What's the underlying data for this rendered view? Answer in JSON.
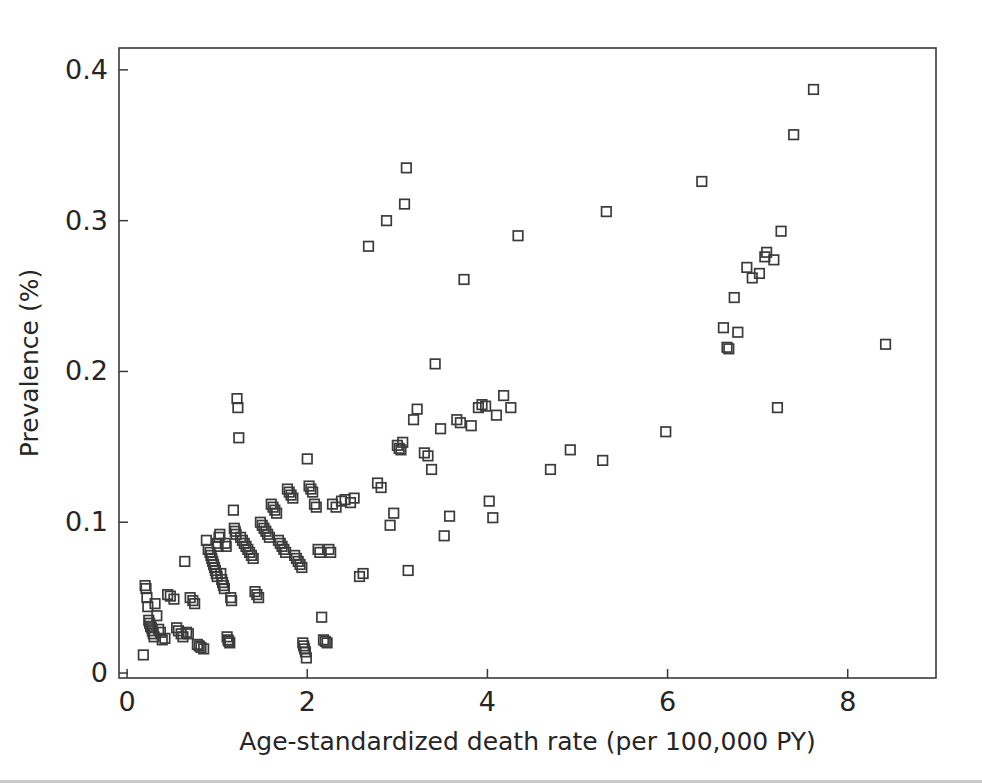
{
  "figure": {
    "background_color": "#ffffff",
    "marker_color": "#3b3b3b",
    "axis_color": "#3a3a3a",
    "marker_shape": "open-square"
  },
  "chart_data": {
    "type": "scatter",
    "title": "",
    "xlabel": "Age-standardized death rate (per 100,000 PY)",
    "ylabel": "Prevalence (%)",
    "xlim": [
      -0.09,
      8.98
    ],
    "ylim": [
      -0.0033,
      0.4145
    ],
    "xticks": [
      0,
      2,
      4,
      6,
      8
    ],
    "xticklabels": [
      "0",
      "2",
      "4",
      "6",
      "8"
    ],
    "yticks": [
      0,
      0.1,
      0.2,
      0.3,
      0.4
    ],
    "yticklabels": [
      "0",
      "0.1",
      "0.2",
      "0.3",
      "0.4"
    ],
    "grid": false,
    "legend": null,
    "series": [
      {
        "name": "countries",
        "marker": "open-square",
        "points": [
          [
            0.18,
            0.012
          ],
          [
            0.2,
            0.058
          ],
          [
            0.21,
            0.056
          ],
          [
            0.22,
            0.05
          ],
          [
            0.23,
            0.044
          ],
          [
            0.24,
            0.035
          ],
          [
            0.25,
            0.033
          ],
          [
            0.26,
            0.031
          ],
          [
            0.27,
            0.03
          ],
          [
            0.28,
            0.028
          ],
          [
            0.29,
            0.026
          ],
          [
            0.3,
            0.024
          ],
          [
            0.31,
            0.046
          ],
          [
            0.33,
            0.038
          ],
          [
            0.35,
            0.029
          ],
          [
            0.37,
            0.027
          ],
          [
            0.39,
            0.022
          ],
          [
            0.42,
            0.023
          ],
          [
            0.45,
            0.052
          ],
          [
            0.48,
            0.051
          ],
          [
            0.52,
            0.049
          ],
          [
            0.55,
            0.03
          ],
          [
            0.57,
            0.028
          ],
          [
            0.6,
            0.026
          ],
          [
            0.62,
            0.024
          ],
          [
            0.64,
            0.074
          ],
          [
            0.66,
            0.027
          ],
          [
            0.68,
            0.026
          ],
          [
            0.7,
            0.05
          ],
          [
            0.73,
            0.048
          ],
          [
            0.75,
            0.046
          ],
          [
            0.78,
            0.019
          ],
          [
            0.8,
            0.018
          ],
          [
            0.82,
            0.017
          ],
          [
            0.85,
            0.016
          ],
          [
            0.88,
            0.088
          ],
          [
            0.9,
            0.082
          ],
          [
            0.92,
            0.08
          ],
          [
            0.93,
            0.078
          ],
          [
            0.94,
            0.076
          ],
          [
            0.95,
            0.074
          ],
          [
            0.96,
            0.072
          ],
          [
            0.97,
            0.07
          ],
          [
            0.98,
            0.068
          ],
          [
            0.99,
            0.066
          ],
          [
            1.0,
            0.064
          ],
          [
            1.0,
            0.086
          ],
          [
            1.01,
            0.084
          ],
          [
            1.02,
            0.09
          ],
          [
            1.03,
            0.092
          ],
          [
            1.04,
            0.066
          ],
          [
            1.05,
            0.062
          ],
          [
            1.06,
            0.06
          ],
          [
            1.07,
            0.058
          ],
          [
            1.08,
            0.056
          ],
          [
            1.09,
            0.086
          ],
          [
            1.1,
            0.084
          ],
          [
            1.11,
            0.024
          ],
          [
            1.12,
            0.022
          ],
          [
            1.13,
            0.021
          ],
          [
            1.14,
            0.02
          ],
          [
            1.15,
            0.05
          ],
          [
            1.16,
            0.048
          ],
          [
            1.18,
            0.108
          ],
          [
            1.19,
            0.096
          ],
          [
            1.2,
            0.094
          ],
          [
            1.21,
            0.092
          ],
          [
            1.22,
            0.182
          ],
          [
            1.23,
            0.176
          ],
          [
            1.24,
            0.156
          ],
          [
            1.26,
            0.09
          ],
          [
            1.28,
            0.088
          ],
          [
            1.3,
            0.086
          ],
          [
            1.32,
            0.084
          ],
          [
            1.34,
            0.082
          ],
          [
            1.36,
            0.08
          ],
          [
            1.38,
            0.078
          ],
          [
            1.4,
            0.076
          ],
          [
            1.42,
            0.054
          ],
          [
            1.44,
            0.052
          ],
          [
            1.46,
            0.05
          ],
          [
            1.48,
            0.1
          ],
          [
            1.5,
            0.098
          ],
          [
            1.52,
            0.096
          ],
          [
            1.54,
            0.094
          ],
          [
            1.56,
            0.092
          ],
          [
            1.58,
            0.09
          ],
          [
            1.6,
            0.112
          ],
          [
            1.62,
            0.11
          ],
          [
            1.64,
            0.108
          ],
          [
            1.66,
            0.106
          ],
          [
            1.68,
            0.088
          ],
          [
            1.7,
            0.086
          ],
          [
            1.72,
            0.084
          ],
          [
            1.74,
            0.082
          ],
          [
            1.76,
            0.08
          ],
          [
            1.78,
            0.122
          ],
          [
            1.8,
            0.12
          ],
          [
            1.82,
            0.118
          ],
          [
            1.84,
            0.116
          ],
          [
            1.86,
            0.078
          ],
          [
            1.88,
            0.076
          ],
          [
            1.9,
            0.074
          ],
          [
            1.92,
            0.072
          ],
          [
            1.94,
            0.07
          ],
          [
            1.95,
            0.02
          ],
          [
            1.96,
            0.018
          ],
          [
            1.97,
            0.016
          ],
          [
            1.98,
            0.014
          ],
          [
            1.99,
            0.01
          ],
          [
            2.0,
            0.142
          ],
          [
            2.02,
            0.124
          ],
          [
            2.04,
            0.122
          ],
          [
            2.06,
            0.12
          ],
          [
            2.08,
            0.112
          ],
          [
            2.1,
            0.11
          ],
          [
            2.12,
            0.082
          ],
          [
            2.14,
            0.08
          ],
          [
            2.16,
            0.037
          ],
          [
            2.18,
            0.022
          ],
          [
            2.2,
            0.021
          ],
          [
            2.22,
            0.02
          ],
          [
            2.24,
            0.082
          ],
          [
            2.26,
            0.08
          ],
          [
            2.28,
            0.112
          ],
          [
            2.32,
            0.11
          ],
          [
            2.38,
            0.114
          ],
          [
            2.42,
            0.115
          ],
          [
            2.48,
            0.113
          ],
          [
            2.52,
            0.116
          ],
          [
            2.58,
            0.064
          ],
          [
            2.62,
            0.066
          ],
          [
            2.68,
            0.283
          ],
          [
            2.78,
            0.126
          ],
          [
            2.82,
            0.123
          ],
          [
            2.88,
            0.3
          ],
          [
            2.92,
            0.098
          ],
          [
            2.96,
            0.106
          ],
          [
            3.0,
            0.151
          ],
          [
            3.02,
            0.149
          ],
          [
            3.04,
            0.148
          ],
          [
            3.06,
            0.153
          ],
          [
            3.08,
            0.311
          ],
          [
            3.1,
            0.335
          ],
          [
            3.12,
            0.068
          ],
          [
            3.18,
            0.168
          ],
          [
            3.22,
            0.175
          ],
          [
            3.3,
            0.146
          ],
          [
            3.34,
            0.144
          ],
          [
            3.38,
            0.135
          ],
          [
            3.42,
            0.205
          ],
          [
            3.48,
            0.162
          ],
          [
            3.52,
            0.091
          ],
          [
            3.58,
            0.104
          ],
          [
            3.66,
            0.168
          ],
          [
            3.7,
            0.166
          ],
          [
            3.74,
            0.261
          ],
          [
            3.82,
            0.164
          ],
          [
            3.9,
            0.176
          ],
          [
            3.94,
            0.178
          ],
          [
            3.98,
            0.177
          ],
          [
            4.02,
            0.114
          ],
          [
            4.06,
            0.103
          ],
          [
            4.1,
            0.171
          ],
          [
            4.18,
            0.184
          ],
          [
            4.26,
            0.176
          ],
          [
            4.34,
            0.29
          ],
          [
            4.7,
            0.135
          ],
          [
            4.92,
            0.148
          ],
          [
            5.28,
            0.141
          ],
          [
            5.32,
            0.306
          ],
          [
            5.98,
            0.16
          ],
          [
            6.38,
            0.326
          ],
          [
            6.62,
            0.229
          ],
          [
            6.66,
            0.216
          ],
          [
            6.68,
            0.215
          ],
          [
            6.74,
            0.249
          ],
          [
            6.78,
            0.226
          ],
          [
            6.88,
            0.269
          ],
          [
            6.94,
            0.262
          ],
          [
            7.02,
            0.265
          ],
          [
            7.08,
            0.276
          ],
          [
            7.1,
            0.279
          ],
          [
            7.18,
            0.274
          ],
          [
            7.22,
            0.176
          ],
          [
            7.26,
            0.293
          ],
          [
            7.4,
            0.357
          ],
          [
            7.62,
            0.387
          ],
          [
            8.42,
            0.218
          ]
        ]
      }
    ]
  }
}
